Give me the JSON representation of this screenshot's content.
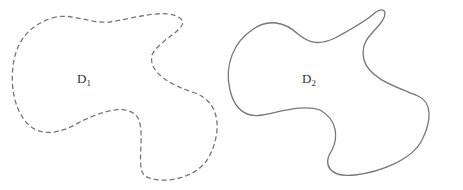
{
  "diagram": {
    "regions": [
      {
        "id": "D1",
        "label": "D",
        "subscript": "1",
        "border_style": "dashed"
      },
      {
        "id": "D2",
        "label": "D",
        "subscript": "2",
        "border_style": "solid"
      }
    ],
    "stroke_color": "#777777",
    "background": "#ffffff"
  }
}
